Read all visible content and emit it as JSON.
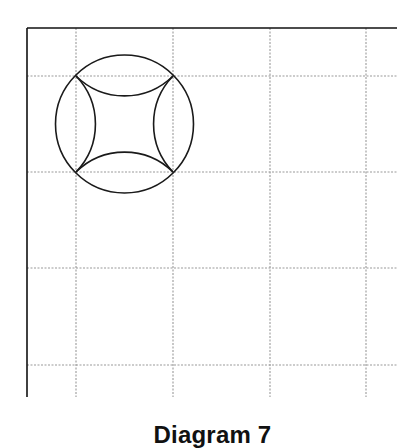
{
  "caption": "Diagram 7",
  "diagram": {
    "frame": {
      "top_line": {
        "x1": 27,
        "y1": 28,
        "x2": 397,
        "y2": 28
      },
      "left_line": {
        "x1": 27,
        "y1": 28,
        "x2": 27,
        "y2": 397
      },
      "color": "#111111"
    },
    "grid": {
      "color": "#9a9a9a",
      "dash": "2,1.5",
      "vertical_x": [
        76,
        173,
        270,
        366
      ],
      "horizontal_y": [
        76,
        172,
        268,
        365
      ],
      "extent": {
        "x_start": 27,
        "x_end": 397,
        "y_start": 28,
        "y_end": 397
      }
    },
    "figure": {
      "circle": {
        "cx": 124.5,
        "cy": 124,
        "r": 69
      },
      "square_corners": [
        [
          76,
          76
        ],
        [
          173,
          76
        ],
        [
          173,
          172
        ],
        [
          76,
          172
        ]
      ],
      "inner_arc_radius": 69,
      "stroke": "#1a1a1a"
    }
  }
}
